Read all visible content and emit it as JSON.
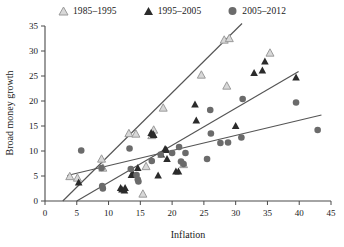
{
  "legend": {
    "position": "top-center",
    "entries": [
      {
        "label": "1985–1995",
        "marker": "open-triangle-icon",
        "color": "#b9b9b9"
      },
      {
        "label": "1995–2005",
        "marker": "filled-triangle-icon",
        "color": "#2b2b2b"
      },
      {
        "label": "2005–2012",
        "marker": "filled-circle-icon",
        "color": "#6b6b6b"
      }
    ]
  },
  "chart_data": {
    "type": "scatter",
    "title": "",
    "xlabel": "Inflation",
    "ylabel": "Broad money growth",
    "xlim": [
      0,
      45
    ],
    "ylim": [
      0,
      35
    ],
    "xticks": [
      0,
      5,
      10,
      15,
      20,
      25,
      30,
      35,
      40,
      45
    ],
    "yticks": [
      0,
      5,
      10,
      15,
      20,
      25,
      30,
      35
    ],
    "grid": false,
    "series": [
      {
        "name": "1985–1995",
        "marker": "open-triangle",
        "color": "#b9b9b9",
        "points": [
          [
            3.9,
            4.9
          ],
          [
            5.1,
            4.6
          ],
          [
            8.9,
            8.4
          ],
          [
            9.1,
            6.6
          ],
          [
            13.2,
            13.5
          ],
          [
            14.3,
            13.4
          ],
          [
            15.4,
            1.4
          ],
          [
            15.9,
            6.9
          ],
          [
            16.8,
            13.1
          ],
          [
            17.1,
            14.2
          ],
          [
            18.6,
            18.6
          ],
          [
            21.8,
            7.3
          ],
          [
            24.6,
            25.2
          ],
          [
            28.2,
            32.2
          ],
          [
            28.6,
            23.0
          ],
          [
            29.0,
            32.5
          ],
          [
            35.4,
            29.6
          ]
        ],
        "trendline": {
          "x": [
            2.8,
            31.0
          ],
          "y": [
            0.0,
            35.5
          ]
        }
      },
      {
        "name": "1995–2005",
        "marker": "filled-triangle",
        "color": "#2b2b2b",
        "points": [
          [
            5.3,
            3.7
          ],
          [
            11.9,
            2.6
          ],
          [
            12.1,
            2.3
          ],
          [
            12.5,
            2.1
          ],
          [
            12.6,
            2.6
          ],
          [
            13.6,
            5.2
          ],
          [
            13.8,
            5.5
          ],
          [
            14.6,
            6.6
          ],
          [
            16.7,
            13.6
          ],
          [
            17.0,
            13.4
          ],
          [
            17.1,
            13.2
          ],
          [
            17.8,
            5.1
          ],
          [
            18.3,
            9.3
          ],
          [
            18.9,
            10.4
          ],
          [
            19.1,
            10.2
          ],
          [
            19.2,
            8.4
          ],
          [
            20.6,
            5.9
          ],
          [
            21.0,
            5.9
          ],
          [
            23.6,
            19.3
          ],
          [
            23.8,
            16.1
          ],
          [
            30.0,
            15.0
          ],
          [
            32.9,
            25.6
          ],
          [
            34.2,
            26.1
          ],
          [
            34.6,
            27.9
          ],
          [
            39.5,
            24.7
          ]
        ],
        "trendline": {
          "x": [
            5.0,
            39.9
          ],
          "y": [
            0.0,
            25.9
          ]
        }
      },
      {
        "name": "2005–2012",
        "marker": "filled-circle",
        "color": "#6b6b6b",
        "points": [
          [
            5.7,
            10.1
          ],
          [
            8.9,
            6.6
          ],
          [
            9.0,
            3.0
          ],
          [
            9.1,
            2.5
          ],
          [
            13.3,
            10.5
          ],
          [
            13.5,
            6.4
          ],
          [
            14.4,
            5.2
          ],
          [
            14.6,
            4.3
          ],
          [
            14.7,
            3.9
          ],
          [
            16.8,
            8.0
          ],
          [
            18.2,
            9.3
          ],
          [
            20.0,
            9.6
          ],
          [
            21.1,
            10.8
          ],
          [
            21.4,
            7.9
          ],
          [
            21.8,
            7.4
          ],
          [
            22.1,
            9.6
          ],
          [
            25.5,
            8.4
          ],
          [
            26.0,
            18.2
          ],
          [
            26.1,
            13.5
          ],
          [
            27.6,
            11.6
          ],
          [
            28.8,
            11.7
          ],
          [
            30.9,
            12.7
          ],
          [
            31.1,
            20.4
          ],
          [
            39.5,
            19.7
          ],
          [
            42.9,
            14.2
          ]
        ],
        "trendline": {
          "x": [
            3.5,
            43.5
          ],
          "y": [
            5.1,
            17.2
          ]
        }
      }
    ]
  }
}
